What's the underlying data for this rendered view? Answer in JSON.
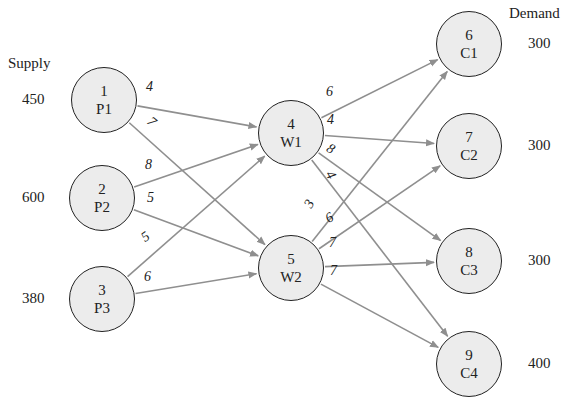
{
  "headers": {
    "supply": "Supply",
    "demand": "Demand"
  },
  "nodes": [
    {
      "id": "1",
      "name": "P1",
      "x": 104,
      "y": 100,
      "side": "supply",
      "amount": "450"
    },
    {
      "id": "2",
      "name": "P2",
      "x": 102,
      "y": 198,
      "side": "supply",
      "amount": "600"
    },
    {
      "id": "3",
      "name": "P3",
      "x": 102,
      "y": 299,
      "side": "supply",
      "amount": "380"
    },
    {
      "id": "4",
      "name": "W1",
      "x": 291,
      "y": 133,
      "side": "warehouse",
      "amount": ""
    },
    {
      "id": "5",
      "name": "W2",
      "x": 291,
      "y": 268,
      "side": "warehouse",
      "amount": ""
    },
    {
      "id": "6",
      "name": "C1",
      "x": 469,
      "y": 44,
      "side": "demand",
      "amount": "300"
    },
    {
      "id": "7",
      "name": "C2",
      "x": 469,
      "y": 146,
      "side": "demand",
      "amount": "300"
    },
    {
      "id": "8",
      "name": "C3",
      "x": 469,
      "y": 261,
      "side": "demand",
      "amount": "300"
    },
    {
      "id": "9",
      "name": "C4",
      "x": 469,
      "y": 364,
      "side": "demand",
      "amount": "400"
    }
  ],
  "edges": [
    {
      "from": "1",
      "to": "4",
      "cost": "4",
      "lx": 150,
      "ly": 88,
      "rot": 0
    },
    {
      "from": "1",
      "to": "5",
      "cost": "7",
      "lx": 152,
      "ly": 123,
      "rot": 40
    },
    {
      "from": "2",
      "to": "4",
      "cost": "8",
      "lx": 149,
      "ly": 166,
      "rot": 0
    },
    {
      "from": "2",
      "to": "5",
      "cost": "5",
      "lx": 151,
      "ly": 199,
      "rot": 0
    },
    {
      "from": "3",
      "to": "4",
      "cost": "5",
      "lx": 146,
      "ly": 238,
      "rot": -35
    },
    {
      "from": "3",
      "to": "5",
      "cost": "6",
      "lx": 148,
      "ly": 278,
      "rot": 0
    },
    {
      "from": "4",
      "to": "6",
      "cost": "6",
      "lx": 330,
      "ly": 93,
      "rot": 0
    },
    {
      "from": "4",
      "to": "7",
      "cost": "4",
      "lx": 331,
      "ly": 121,
      "rot": 0
    },
    {
      "from": "4",
      "to": "8",
      "cost": "8",
      "lx": 331,
      "ly": 150,
      "rot": 30
    },
    {
      "from": "4",
      "to": "9",
      "cost": "4",
      "lx": 331,
      "ly": 176,
      "rot": 60
    },
    {
      "from": "5",
      "to": "6",
      "cost": "3",
      "lx": 310,
      "ly": 205,
      "rot": -60
    },
    {
      "from": "5",
      "to": "7",
      "cost": "6",
      "lx": 330,
      "ly": 219,
      "rot": -30
    },
    {
      "from": "5",
      "to": "8",
      "cost": "7",
      "lx": 333,
      "ly": 244,
      "rot": 0
    },
    {
      "from": "5",
      "to": "9",
      "cost": "7",
      "lx": 334,
      "ly": 272,
      "rot": 0
    }
  ],
  "style": {
    "edge_color": "#8f8f8f",
    "node_fill": "#ececec",
    "node_stroke": "#222222"
  }
}
